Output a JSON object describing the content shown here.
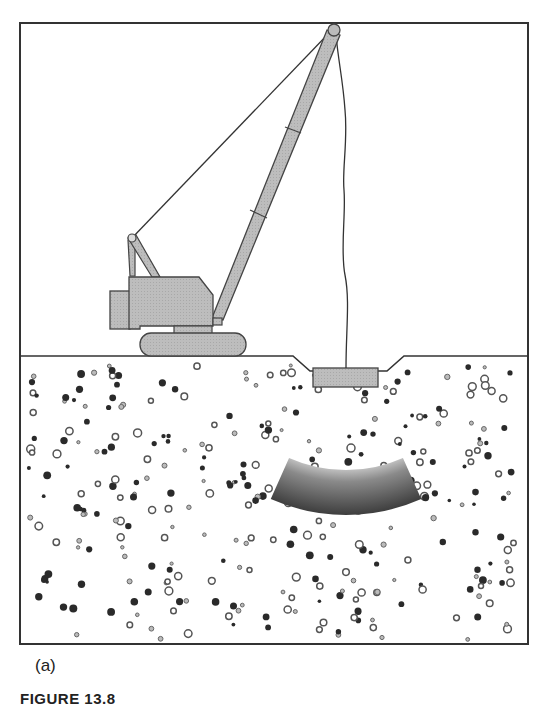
{
  "figure": {
    "panel_label": "(a)",
    "caption": "FIGURE 13.8"
  },
  "colors": {
    "frame": "#333333",
    "machine_fill": "#b8b8b8",
    "machine_stroke": "#444444",
    "soil_dot_dark": "#2a2a2a",
    "soil_ring": "#555555",
    "compacted_zone_dark": "#4a4a4a",
    "compacted_zone_light": "#d8d8d8"
  },
  "scene": {
    "frame": {
      "x": 20,
      "y": 23,
      "w": 508,
      "h": 621
    },
    "ground_y": 356,
    "crater": {
      "left_top": 293,
      "left_bottom": 310,
      "right_bottom": 387,
      "right_top": 404,
      "bottom_y": 371
    },
    "tamper_weight": {
      "x": 313,
      "y": 368,
      "w": 65,
      "h": 19
    },
    "crane_tip": {
      "x": 334,
      "y": 30,
      "r": 6
    },
    "compacted_zone": {
      "cx": 346,
      "cy": 330,
      "r_outer": 185,
      "r_inner": 140,
      "start_deg": 66,
      "end_deg": 114
    }
  },
  "elements": {
    "crane": "crawler-crane",
    "boom": "lattice-boom",
    "cable": "hoist-cable",
    "weight": "drop-weight",
    "soil": "granular-soil",
    "zone": "compaction-zone"
  }
}
